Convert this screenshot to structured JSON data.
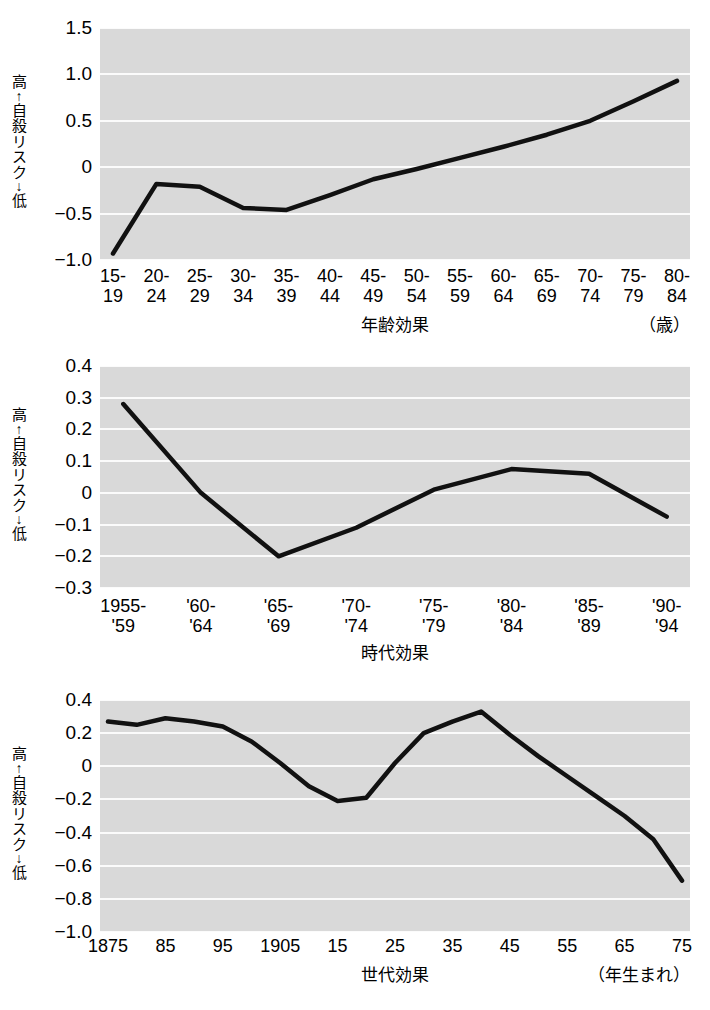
{
  "figure": {
    "y_axis_caption": [
      "高",
      "↑",
      "自",
      "殺",
      "リ",
      "ス",
      "ク",
      "↓",
      "低"
    ],
    "y_axis_caption_text": "高↑自殺リスク↓低"
  },
  "chart_data": [
    {
      "id": "age-effect",
      "type": "line",
      "title": "",
      "xlabel": "年齢効果",
      "xlabel_unit": "（歳）",
      "ylabel": "高↑自殺リスク↓低",
      "categories": [
        "15-\n19",
        "20-\n24",
        "25-\n29",
        "30-\n34",
        "35-\n39",
        "40-\n44",
        "45-\n49",
        "50-\n54",
        "55-\n59",
        "60-\n64",
        "65-\n69",
        "70-\n74",
        "75-\n79",
        "80-\n84"
      ],
      "values": [
        -0.93,
        -0.18,
        -0.21,
        -0.44,
        -0.46,
        -0.3,
        -0.13,
        -0.02,
        0.1,
        0.22,
        0.35,
        0.5,
        0.71,
        0.93
      ],
      "ylim": [
        -1.0,
        1.5
      ],
      "yticks": [
        "1.5",
        "1.0",
        "0.5",
        "0",
        "-0.5",
        "-1.0"
      ],
      "ytick_values": [
        1.5,
        1.0,
        0.5,
        0,
        -0.5,
        -1.0
      ],
      "grid": true,
      "legend": "none",
      "line_color": "#111111"
    },
    {
      "id": "period-effect",
      "type": "line",
      "title": "",
      "xlabel": "時代効果",
      "xlabel_unit": "",
      "ylabel": "高↑自殺リスク↓低",
      "categories": [
        "1955-\n'59",
        "'60-\n'64",
        "'65-\n'69",
        "'70-\n'74",
        "'75-\n'79",
        "'80-\n'84",
        "'85-\n'89",
        "'90-\n'94"
      ],
      "values": [
        0.28,
        0.0,
        -0.2,
        -0.11,
        0.01,
        0.075,
        0.06,
        -0.075
      ],
      "ylim": [
        -0.3,
        0.4
      ],
      "yticks": [
        "0.4",
        "0.3",
        "0.2",
        "0.1",
        "0",
        "-0.1",
        "-0.2",
        "-0.3"
      ],
      "ytick_values": [
        0.4,
        0.3,
        0.2,
        0.1,
        0,
        -0.1,
        -0.2,
        -0.3
      ],
      "grid": true,
      "legend": "none",
      "line_color": "#111111"
    },
    {
      "id": "cohort-effect",
      "type": "line",
      "title": "",
      "xlabel": "世代効果",
      "xlabel_unit": "（年生まれ）",
      "ylabel": "高↑自殺リスク↓低",
      "categories": [
        "1875",
        "85",
        "95",
        "1905",
        "15",
        "25",
        "35",
        "45",
        "55",
        "65",
        "75"
      ],
      "tick_categories": [
        "1875",
        "85",
        "95",
        "1905",
        "15",
        "25",
        "35",
        "45",
        "55",
        "65",
        "75"
      ],
      "x": [
        1875,
        1880,
        1885,
        1890,
        1895,
        1900,
        1905,
        1910,
        1915,
        1920,
        1925,
        1930,
        1935,
        1940,
        1945,
        1950,
        1955,
        1960,
        1965,
        1970,
        1975
      ],
      "values": [
        0.27,
        0.25,
        0.29,
        0.27,
        0.24,
        0.15,
        0.02,
        -0.12,
        -0.21,
        -0.19,
        0.02,
        0.2,
        0.27,
        0.33,
        0.19,
        0.06,
        -0.06,
        -0.18,
        -0.3,
        -0.44,
        -0.69
      ],
      "ylim": [
        -1.0,
        0.4
      ],
      "yticks": [
        "0.4",
        "0.2",
        "0",
        "-0.2",
        "-0.4",
        "-0.6",
        "-0.8",
        "-1.0"
      ],
      "ytick_values": [
        0.4,
        0.2,
        0,
        -0.2,
        -0.4,
        -0.6,
        -0.8,
        -1.0
      ],
      "grid": true,
      "legend": "none",
      "line_color": "#111111"
    }
  ]
}
